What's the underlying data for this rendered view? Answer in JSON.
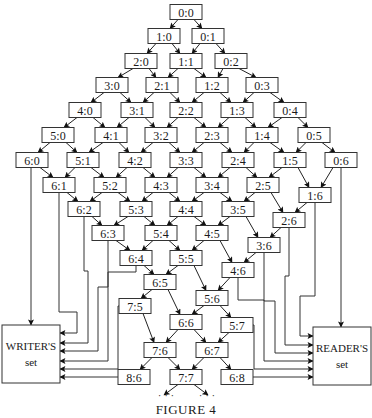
{
  "figure": {
    "caption": "Figure 4",
    "caption_display": "FIGURE 4",
    "continuation_marks": [
      "· · ·",
      "· · ·"
    ]
  },
  "writer_set": {
    "label_line1": "Writer's",
    "label_line1_display": "WRITER'S",
    "label_line2": "set"
  },
  "reader_set": {
    "label_line1": "Reader's",
    "label_line1_display": "READER'S",
    "label_line2": "set"
  },
  "nodes": [
    {
      "id": "0:0",
      "x": 186,
      "y": 12
    },
    {
      "id": "1:0",
      "x": 164,
      "y": 36
    },
    {
      "id": "0:1",
      "x": 208,
      "y": 36
    },
    {
      "id": "2:0",
      "x": 141,
      "y": 61
    },
    {
      "id": "1:1",
      "x": 186,
      "y": 61
    },
    {
      "id": "0:2",
      "x": 231,
      "y": 61
    },
    {
      "id": "3:0",
      "x": 112,
      "y": 85
    },
    {
      "id": "2:1",
      "x": 162,
      "y": 85
    },
    {
      "id": "1:2",
      "x": 212,
      "y": 85
    },
    {
      "id": "0:3",
      "x": 262,
      "y": 85
    },
    {
      "id": "4:0",
      "x": 85,
      "y": 110
    },
    {
      "id": "3:1",
      "x": 137,
      "y": 110
    },
    {
      "id": "2:2",
      "x": 186,
      "y": 110
    },
    {
      "id": "1:3",
      "x": 237,
      "y": 110
    },
    {
      "id": "0:4",
      "x": 290,
      "y": 110
    },
    {
      "id": "5:0",
      "x": 58,
      "y": 135
    },
    {
      "id": "4:1",
      "x": 111,
      "y": 135
    },
    {
      "id": "3:2",
      "x": 161,
      "y": 135
    },
    {
      "id": "2:3",
      "x": 212,
      "y": 135
    },
    {
      "id": "1:4",
      "x": 262,
      "y": 135
    },
    {
      "id": "0:5",
      "x": 314,
      "y": 135
    },
    {
      "id": "6:0",
      "x": 32,
      "y": 160
    },
    {
      "id": "5:1",
      "x": 83,
      "y": 160
    },
    {
      "id": "4:2",
      "x": 135,
      "y": 160
    },
    {
      "id": "3:3",
      "x": 186,
      "y": 160
    },
    {
      "id": "2:4",
      "x": 238,
      "y": 160
    },
    {
      "id": "1:5",
      "x": 290,
      "y": 160
    },
    {
      "id": "0:6",
      "x": 341,
      "y": 160
    },
    {
      "id": "6:1",
      "x": 59,
      "y": 185
    },
    {
      "id": "5:2",
      "x": 110,
      "y": 185
    },
    {
      "id": "4:3",
      "x": 161,
      "y": 185
    },
    {
      "id": "3:4",
      "x": 212,
      "y": 185
    },
    {
      "id": "2:5",
      "x": 263,
      "y": 185
    },
    {
      "id": "1:6",
      "x": 315,
      "y": 195
    },
    {
      "id": "6:2",
      "x": 84,
      "y": 209
    },
    {
      "id": "5:3",
      "x": 136,
      "y": 209
    },
    {
      "id": "4:4",
      "x": 186,
      "y": 209
    },
    {
      "id": "3:5",
      "x": 238,
      "y": 209
    },
    {
      "id": "2:6",
      "x": 289,
      "y": 220
    },
    {
      "id": "6:3",
      "x": 108,
      "y": 233
    },
    {
      "id": "5:4",
      "x": 161,
      "y": 233
    },
    {
      "id": "4:5",
      "x": 212,
      "y": 233
    },
    {
      "id": "3:6",
      "x": 264,
      "y": 245
    },
    {
      "id": "6:4",
      "x": 136,
      "y": 258
    },
    {
      "id": "5:5",
      "x": 186,
      "y": 258
    },
    {
      "id": "4:6",
      "x": 238,
      "y": 270
    },
    {
      "id": "6:5",
      "x": 160,
      "y": 282
    },
    {
      "id": "5:6",
      "x": 212,
      "y": 298
    },
    {
      "id": "7:5",
      "x": 135,
      "y": 306
    },
    {
      "id": "6:6",
      "x": 186,
      "y": 322
    },
    {
      "id": "5:7",
      "x": 237,
      "y": 325
    },
    {
      "id": "7:6",
      "x": 160,
      "y": 350
    },
    {
      "id": "6:7",
      "x": 212,
      "y": 350
    },
    {
      "id": "8:6",
      "x": 134,
      "y": 377
    },
    {
      "id": "7:7",
      "x": 186,
      "y": 377
    },
    {
      "id": "6:8",
      "x": 237,
      "y": 377
    }
  ]
}
